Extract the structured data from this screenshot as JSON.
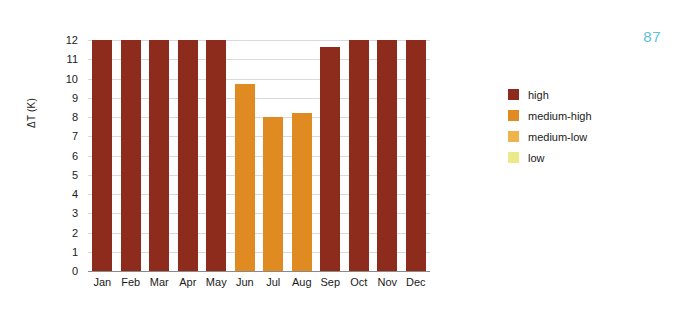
{
  "page_number": "87",
  "colors": {
    "high": "#8d2b1c",
    "medium_high": "#e08a22",
    "medium_low": "#eeb44a",
    "low": "#ece98a",
    "page_number": "#5bc0de",
    "gridline": "#d9d9d9",
    "axis": "#8a8a8a",
    "text": "#1a1a1a"
  },
  "legend": {
    "position": "right",
    "items": [
      {
        "label": "high",
        "color": "#8d2b1c"
      },
      {
        "label": "medium-high",
        "color": "#e08a22"
      },
      {
        "label": "medium-low",
        "color": "#eeb44a"
      },
      {
        "label": "low",
        "color": "#ece98a"
      }
    ]
  },
  "chart_data": {
    "type": "bar",
    "title": "",
    "xlabel": "",
    "ylabel": "ΔT (K)",
    "ylim": [
      0,
      12
    ],
    "ytick_labels": [
      "12",
      "11",
      "10",
      "9",
      "8",
      "7",
      "6",
      "5",
      "4",
      "3",
      "2",
      "1",
      "0"
    ],
    "ytick_values": [
      12,
      11,
      10,
      9,
      8,
      7,
      6,
      5,
      4,
      3,
      2,
      1,
      0
    ],
    "grid": true,
    "grid_axis": "y",
    "categories": [
      "Jan",
      "Feb",
      "Mar",
      "Apr",
      "May",
      "Jun",
      "Jul",
      "Aug",
      "Sep",
      "Oct",
      "Nov",
      "Dec"
    ],
    "values": [
      12.0,
      12.0,
      12.0,
      12.0,
      12.0,
      9.7,
      8.0,
      8.2,
      11.65,
      12.0,
      12.0,
      12.0
    ],
    "bar_categories": [
      "high",
      "high",
      "high",
      "high",
      "high",
      "medium-high",
      "medium-high",
      "medium-high",
      "high",
      "high",
      "high",
      "high"
    ],
    "bar_colors": [
      "#8d2b1c",
      "#8d2b1c",
      "#8d2b1c",
      "#8d2b1c",
      "#8d2b1c",
      "#e08a22",
      "#e08a22",
      "#e08a22",
      "#8d2b1c",
      "#8d2b1c",
      "#8d2b1c",
      "#8d2b1c"
    ],
    "legend_entries": [
      "high",
      "medium-high",
      "medium-low",
      "low"
    ]
  }
}
